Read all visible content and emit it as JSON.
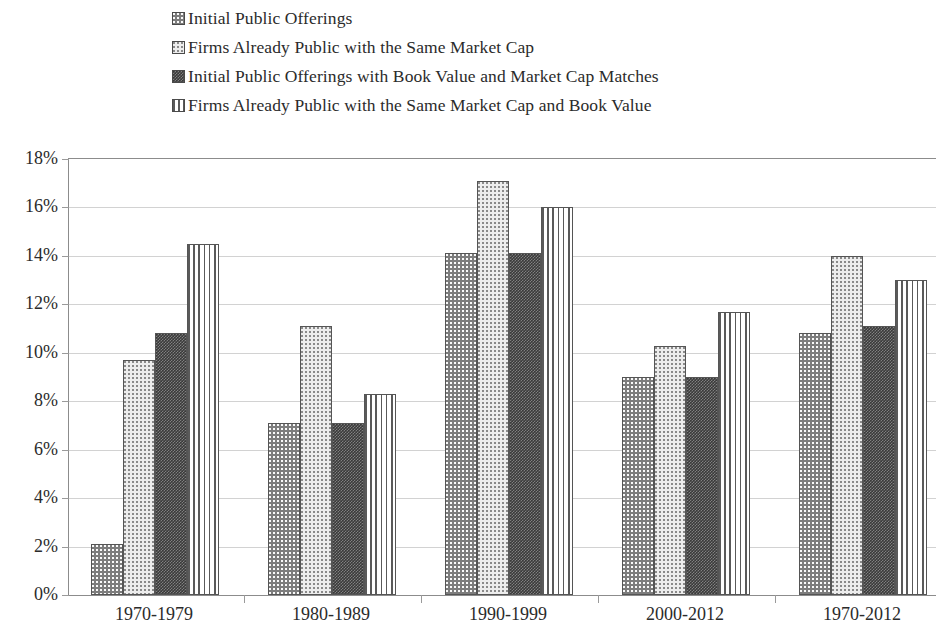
{
  "chart_data": {
    "type": "bar",
    "title": "",
    "xlabel": "",
    "ylabel": "",
    "ylim": [
      0,
      18
    ],
    "ytick_values": [
      0,
      2,
      4,
      6,
      8,
      10,
      12,
      14,
      16,
      18
    ],
    "ytick_labels": [
      "0%",
      "2%",
      "4%",
      "6%",
      "8%",
      "10%",
      "12%",
      "14%",
      "16%",
      "18%"
    ],
    "grid": true,
    "legend_position": "top-left",
    "categories": [
      "1970-1979",
      "1980-1989",
      "1990-1999",
      "2000-2012",
      "1970-2012"
    ],
    "series": [
      {
        "name": "Initial Public Offerings",
        "pattern": "medium-gray-stipple",
        "color": "#7d7d7d",
        "values": [
          2.1,
          7.1,
          14.1,
          9.0,
          10.8
        ]
      },
      {
        "name": "Firms Already Public with the Same Market Cap",
        "pattern": "light-gray-stipple",
        "color": "#ededed",
        "values": [
          9.7,
          11.1,
          17.1,
          10.3,
          14.0
        ]
      },
      {
        "name": "Initial Public Offerings with Book Value and Market Cap Matches",
        "pattern": "dark-gray-checkerboard",
        "color": "#3a3a3a",
        "values": [
          10.8,
          7.1,
          14.1,
          9.0,
          11.1
        ]
      },
      {
        "name": "Firms Already Public with the Same Market Cap and Book Value",
        "pattern": "white-vertical-lines",
        "color": "#ffffff",
        "values": [
          14.5,
          8.3,
          16.0,
          11.7,
          13.0
        ]
      }
    ]
  },
  "legend": {
    "items": [
      {
        "label": "Initial Public Offerings"
      },
      {
        "label": "Firms Already Public with the Same Market Cap"
      },
      {
        "label": "Initial Public Offerings with Book Value and Market Cap Matches"
      },
      {
        "label": "Firms Already Public with the Same Market Cap and Book Value"
      }
    ]
  }
}
